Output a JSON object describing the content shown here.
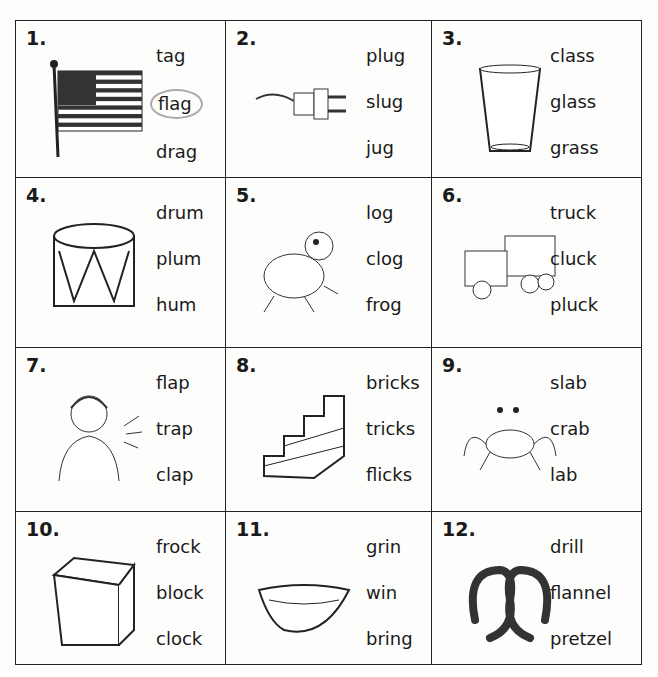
{
  "worksheet": {
    "items": [
      {
        "number": "1.",
        "picture": "flag-icon",
        "words": [
          "tag",
          "flag",
          "drag"
        ],
        "circled": "flag"
      },
      {
        "number": "2.",
        "picture": "plug-icon",
        "words": [
          "plug",
          "slug",
          "jug"
        ],
        "circled": null
      },
      {
        "number": "3.",
        "picture": "glass-icon",
        "words": [
          "class",
          "glass",
          "grass"
        ],
        "circled": null
      },
      {
        "number": "4.",
        "picture": "drum-icon",
        "words": [
          "drum",
          "plum",
          "hum"
        ],
        "circled": null
      },
      {
        "number": "5.",
        "picture": "frog-icon",
        "words": [
          "log",
          "clog",
          "frog"
        ],
        "circled": null
      },
      {
        "number": "6.",
        "picture": "truck-icon",
        "words": [
          "truck",
          "cluck",
          "pluck"
        ],
        "circled": null
      },
      {
        "number": "7.",
        "picture": "clapping-woman-icon",
        "words": [
          "flap",
          "trap",
          "clap"
        ],
        "circled": null
      },
      {
        "number": "8.",
        "picture": "bricks-icon",
        "words": [
          "bricks",
          "tricks",
          "flicks"
        ],
        "circled": null
      },
      {
        "number": "9.",
        "picture": "crab-icon",
        "words": [
          "slab",
          "crab",
          "lab"
        ],
        "circled": null
      },
      {
        "number": "10.",
        "picture": "block-icon",
        "words": [
          "frock",
          "block",
          "clock"
        ],
        "circled": null
      },
      {
        "number": "11.",
        "picture": "grin-icon",
        "words": [
          "grin",
          "win",
          "bring"
        ],
        "circled": null
      },
      {
        "number": "12.",
        "picture": "pretzel-icon",
        "words": [
          "drill",
          "flannel",
          "pretzel"
        ],
        "circled": null
      }
    ]
  }
}
